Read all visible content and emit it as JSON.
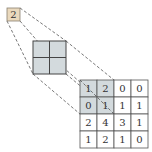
{
  "diagram": {
    "type": "max-pooling-illustration",
    "output": {
      "value": "2",
      "fill": "#ead9bd",
      "stroke": "#8a8070"
    },
    "kernel": {
      "rows": 2,
      "cols": 2,
      "fill": "#d3dadd",
      "stroke": "#444444"
    },
    "input": {
      "rows": [
        [
          "1",
          "2",
          "0",
          "0"
        ],
        [
          "0",
          "1",
          "1",
          "1"
        ],
        [
          "2",
          "4",
          "3",
          "1"
        ],
        [
          "1",
          "2",
          "1",
          "0"
        ]
      ],
      "highlight": {
        "rows": [
          0,
          1
        ],
        "cols": [
          0,
          1
        ],
        "fill": "#d3dadd"
      },
      "stroke": "#555555"
    },
    "connector_style": {
      "stroke": "#555555",
      "dash": "3,2"
    }
  }
}
